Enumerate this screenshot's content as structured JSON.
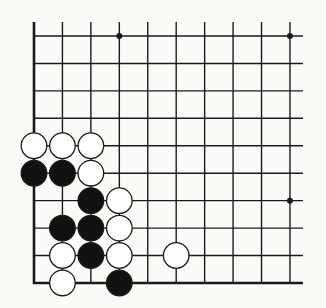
{
  "board": {
    "title": "Go board corner diagram",
    "cols": 10,
    "rows": 10,
    "origin": {
      "x": 34,
      "y": 36
    },
    "spacing": {
      "x": 28.44,
      "y": 27.44
    },
    "line_extend_right": 13,
    "line_extend_top": 14,
    "edges": {
      "left": true,
      "bottom": true,
      "top": false,
      "right": false
    },
    "colors": {
      "background": "#fbfaf6",
      "line": "#1a1a1a",
      "black_stone": "#111111",
      "white_stone": "#ffffff",
      "stone_outline": "#1a1a1a"
    },
    "star_points": [
      {
        "col": 3,
        "row": 0
      },
      {
        "col": 9,
        "row": 0
      },
      {
        "col": 9,
        "row": 6
      }
    ],
    "stones": [
      {
        "color": "white",
        "col": 0,
        "row": 4
      },
      {
        "color": "white",
        "col": 1,
        "row": 4
      },
      {
        "color": "white",
        "col": 2,
        "row": 4
      },
      {
        "color": "black",
        "col": 0,
        "row": 5
      },
      {
        "color": "black",
        "col": 1,
        "row": 5
      },
      {
        "color": "white",
        "col": 2,
        "row": 5
      },
      {
        "color": "black",
        "col": 2,
        "row": 6
      },
      {
        "color": "white",
        "col": 3,
        "row": 6
      },
      {
        "color": "black",
        "col": 1,
        "row": 7
      },
      {
        "color": "black",
        "col": 2,
        "row": 7
      },
      {
        "color": "white",
        "col": 3,
        "row": 7
      },
      {
        "color": "white",
        "col": 1,
        "row": 8
      },
      {
        "color": "black",
        "col": 2,
        "row": 8
      },
      {
        "color": "white",
        "col": 3,
        "row": 8
      },
      {
        "color": "white",
        "col": 5,
        "row": 8
      },
      {
        "color": "white",
        "col": 1,
        "row": 9
      },
      {
        "color": "black",
        "col": 3,
        "row": 9
      }
    ]
  }
}
